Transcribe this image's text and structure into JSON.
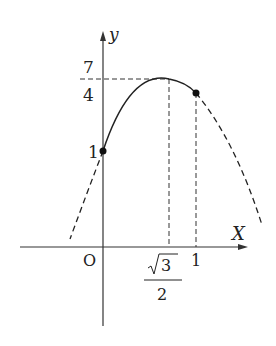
{
  "diagram": {
    "type": "function-graph",
    "axes": {
      "x_label": "X",
      "y_label": "y",
      "origin_label": "O"
    },
    "y_ticks": {
      "top": {
        "numerator": "7",
        "denominator": "4"
      },
      "one": "1"
    },
    "x_ticks": {
      "vertex": {
        "radical": "3",
        "denominator": "2"
      },
      "one": "1"
    },
    "points": [
      {
        "name": "y-intercept",
        "x": "0",
        "y": "1"
      },
      {
        "name": "point-at-x1",
        "x": "1",
        "y": ""
      }
    ],
    "vertex": {
      "x": "√3/2",
      "y": "7/4"
    }
  }
}
